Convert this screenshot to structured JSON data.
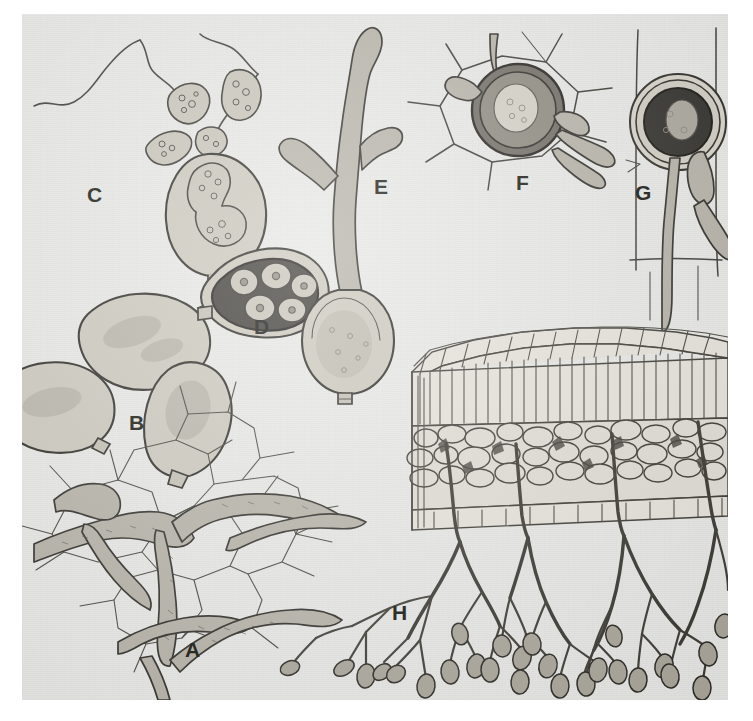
{
  "plate": {
    "kind": "scientific-illustration-plate",
    "subject": "Downy mildew (Oomycete) life-cycle stages",
    "background_color": "#e8e8e6",
    "ink_color": "#2b2a26",
    "page_color": "#ffffff",
    "width": 753,
    "height": 721
  },
  "panels": [
    {
      "id": "A",
      "label": "A",
      "label_x": 163,
      "label_y": 625,
      "caption": "Intercellular mycelium ramifying between host leaf cells",
      "features": [
        "branched coenocytic hyphae",
        "polygonal host cell outlines"
      ]
    },
    {
      "id": "B",
      "label": "B",
      "label_x": 107,
      "label_y": 398,
      "caption": "Mature lemon-shaped sporangia with apical papilla",
      "count": 3,
      "features": [
        "granular cytoplasm",
        "papilla",
        "ovoid outline"
      ]
    },
    {
      "id": "C",
      "label": "C",
      "label_x": 65,
      "label_y": 170,
      "caption": "Sporangium releasing biflagellate zoospores",
      "zoospore_count": 3,
      "features": [
        "flagella",
        "emerging zoospores",
        "empty sporangium"
      ]
    },
    {
      "id": "D",
      "label": "D",
      "label_x": 232,
      "label_y": 302,
      "caption": "Sporangium with internally differentiated zoospores",
      "zoospore_count": 5,
      "features": [
        "dark contents",
        "cleaved zoospores",
        "papilla"
      ]
    },
    {
      "id": "E",
      "label": "E",
      "label_x": 352,
      "label_y": 162,
      "caption": "Germinating sporangium producing a branched germ tube",
      "features": [
        "germ tube",
        "two branches",
        "empty sporangium base"
      ]
    },
    {
      "id": "F",
      "label": "F",
      "label_x": 494,
      "label_y": 158,
      "caption": "Oospore formed within a host cell, attached hyphae visible",
      "features": [
        "thick-walled oospore",
        "host cell wall network",
        "attached hyphae"
      ]
    },
    {
      "id": "G",
      "label": "G",
      "label_x": 613,
      "label_y": 168,
      "caption": "Oospore with thickened wall inside elongated host cell",
      "features": [
        "double oospore wall",
        "dark oosphere",
        "antheridium",
        "oogonium stalk"
      ]
    },
    {
      "id": "H",
      "label": "H",
      "label_x": 370,
      "label_y": 588,
      "caption": "Leaf cross-section with sporangiophores emerging from the lower surface bearing sporangia",
      "features": [
        "upper epidermis",
        "palisade mesophyll",
        "spongy mesophyll",
        "lower epidermis",
        "dichotomously branched sporangiophores",
        "terminal sporangia"
      ]
    }
  ]
}
